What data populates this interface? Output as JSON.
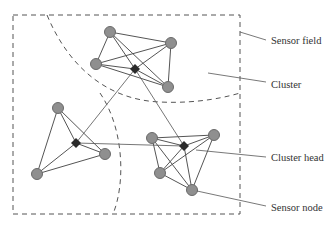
{
  "diagram": {
    "labels": {
      "sensor_field": "Sensor field",
      "cluster": "Cluster",
      "cluster_head": "Cluster head",
      "sensor_node": "Sensor node"
    },
    "colors": {
      "node_fill": "#8f8f8f",
      "node_stroke": "#6a6a6a",
      "head_fill": "#2a2a2a",
      "edge": "#555555",
      "dash": "#555555"
    },
    "clusters": [
      {
        "name": "top",
        "head": [
          135,
          69
        ],
        "nodes": [
          [
            110,
            32
          ],
          [
            171,
            43
          ],
          [
            96,
            64
          ],
          [
            168,
            87
          ]
        ]
      },
      {
        "name": "left",
        "head": [
          76,
          143
        ],
        "nodes": [
          [
            58,
            108
          ],
          [
            105,
            154
          ],
          [
            37,
            174
          ]
        ]
      },
      {
        "name": "right",
        "head": [
          184,
          146
        ],
        "nodes": [
          [
            152,
            138
          ],
          [
            214,
            135
          ],
          [
            160,
            173
          ],
          [
            192,
            190
          ]
        ]
      }
    ]
  }
}
